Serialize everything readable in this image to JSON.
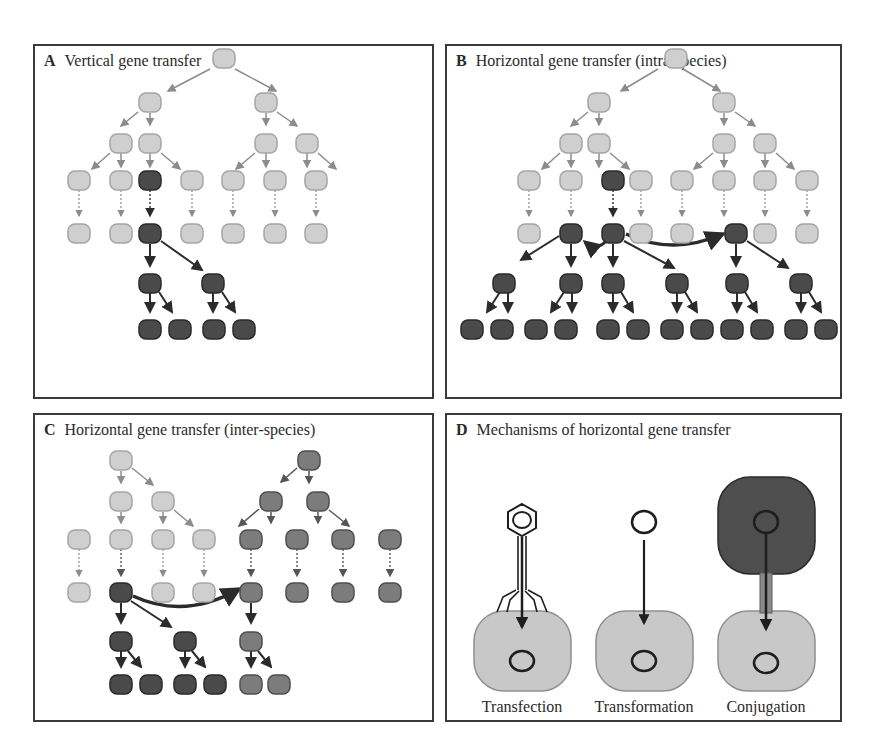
{
  "figure": {
    "colors": {
      "light_cell": "#cfcfcf",
      "light_border": "#a5a5a5",
      "dark_cell": "#4a4a4a",
      "dark_border": "#2a2a2a",
      "species2_cell": "#7c7c7c",
      "species2_border": "#4e4e4e",
      "light_arrow": "#8c8c8c",
      "dark_arrow": "#2b2b2b"
    },
    "panels": [
      {
        "letter": "A",
        "title": "Vertical gene transfer"
      },
      {
        "letter": "B",
        "title": "Horizontal gene transfer (intra-species)"
      },
      {
        "letter": "C",
        "title": "Horizontal gene transfer (inter-species)"
      },
      {
        "letter": "D",
        "title": "Mechanisms of horizontal gene transfer"
      }
    ],
    "mechanisms": [
      {
        "label": "Transfection",
        "icon": "bacteriophage-icon"
      },
      {
        "label": "Transformation",
        "icon": "free-dna-plasmid-icon"
      },
      {
        "label": "Conjugation",
        "icon": "donor-cell-icon"
      }
    ]
  }
}
